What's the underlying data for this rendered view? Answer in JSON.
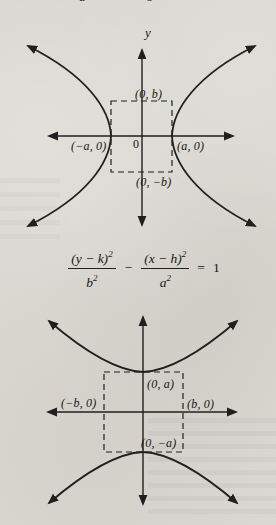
{
  "page": {
    "background_color": "#dad8d1",
    "ink_color": "#1f1f1f",
    "top_fragment_left": "a",
    "top_fragment_right": "b"
  },
  "diagram_horizontal": {
    "y_axis_label": "y",
    "origin_label": "0",
    "vertex_top_label": "(0, b)",
    "vertex_left_label": "(−a, 0)",
    "vertex_right_label": "(a, 0)",
    "vertex_bottom_label": "(0, −b)"
  },
  "equation": {
    "numerator_1": "(y − k)",
    "numerator_1_exponent": "2",
    "denominator_1": "b",
    "denominator_1_exponent": "2",
    "operator": "−",
    "numerator_2": "(x − h)",
    "numerator_2_exponent": "2",
    "denominator_2": "a",
    "denominator_2_exponent": "2",
    "equals_sign": "=",
    "right_hand_side": "1"
  },
  "diagram_vertical": {
    "vertex_top_label": "(0, a)",
    "x_intercept_left_label": "(−b, 0)",
    "x_intercept_right_label": "(b, 0)",
    "vertex_bottom_label": "(0, −a)"
  }
}
